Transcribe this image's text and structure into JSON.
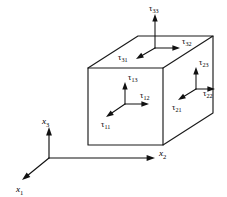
{
  "figure": {
    "background_color": "#ffffff",
    "line_color": "#1a1a1a",
    "text_color": "#000000",
    "width": 227,
    "height": 197
  },
  "axes": {
    "origin": {
      "x": 49,
      "y": 158
    },
    "items": [
      {
        "name": "x1",
        "symbol": "x",
        "subscript": "1",
        "direction": "down-left",
        "tip": {
          "x": 22,
          "y": 180
        },
        "label_pos": {
          "x": 16,
          "y": 192
        }
      },
      {
        "name": "x2",
        "symbol": "x",
        "subscript": "2",
        "direction": "right",
        "tip": {
          "x": 155,
          "y": 158
        },
        "label_pos": {
          "x": 159,
          "y": 156
        }
      },
      {
        "name": "x3",
        "symbol": "x",
        "subscript": "3",
        "direction": "up",
        "tip": {
          "x": 49,
          "y": 127
        },
        "label_pos": {
          "x": 42,
          "y": 124
        }
      }
    ]
  },
  "cube": {
    "front_face": {
      "x": 88,
      "y": 68,
      "width": 75,
      "height": 77
    },
    "depth_offset": {
      "dx": 50,
      "dy": -32
    },
    "vertices": {
      "front_top_left": {
        "x": 88,
        "y": 68
      },
      "front_top_right": {
        "x": 163,
        "y": 68
      },
      "front_bottom_right": {
        "x": 163,
        "y": 145
      },
      "front_bottom_left": {
        "x": 88,
        "y": 145
      },
      "back_top_left": {
        "x": 138,
        "y": 36
      },
      "back_top_right": {
        "x": 213,
        "y": 36
      },
      "back_bottom_right": {
        "x": 213,
        "y": 113
      }
    }
  },
  "tractions": [
    {
      "name": "tau-33",
      "symbol": "τ",
      "subscript": "33",
      "face": "top",
      "component": "normal",
      "origin": {
        "x": 155,
        "y": 48
      },
      "tip": {
        "x": 155,
        "y": 14
      },
      "label_pos": {
        "x": 149,
        "y": 11
      }
    },
    {
      "name": "tau-32",
      "symbol": "τ",
      "subscript": "32",
      "face": "top",
      "component": "shear",
      "origin": {
        "x": 155,
        "y": 48
      },
      "tip": {
        "x": 180,
        "y": 48
      },
      "label_pos": {
        "x": 182,
        "y": 44
      }
    },
    {
      "name": "tau-31",
      "symbol": "τ",
      "subscript": "31",
      "face": "top",
      "component": "shear",
      "origin": {
        "x": 155,
        "y": 48
      },
      "tip": {
        "x": 136,
        "y": 59
      },
      "label_pos": {
        "x": 118,
        "y": 60
      }
    },
    {
      "name": "tau-13",
      "symbol": "τ",
      "subscript": "13",
      "face": "front",
      "component": "shear",
      "origin": {
        "x": 125,
        "y": 104
      },
      "tip": {
        "x": 125,
        "y": 82
      },
      "label_pos": {
        "x": 128,
        "y": 80
      }
    },
    {
      "name": "tau-12",
      "symbol": "τ",
      "subscript": "12",
      "face": "front",
      "component": "shear",
      "origin": {
        "x": 125,
        "y": 104
      },
      "tip": {
        "x": 149,
        "y": 104
      },
      "label_pos": {
        "x": 140,
        "y": 98
      }
    },
    {
      "name": "tau-11",
      "symbol": "τ",
      "subscript": "11",
      "face": "front",
      "component": "normal",
      "origin": {
        "x": 125,
        "y": 104
      },
      "tip": {
        "x": 106,
        "y": 117
      },
      "label_pos": {
        "x": 101,
        "y": 127
      }
    },
    {
      "name": "tau-23",
      "symbol": "τ",
      "subscript": "23",
      "face": "right",
      "component": "shear",
      "origin": {
        "x": 196,
        "y": 89
      },
      "tip": {
        "x": 196,
        "y": 67
      },
      "label_pos": {
        "x": 199,
        "y": 65
      }
    },
    {
      "name": "tau-22",
      "symbol": "τ",
      "subscript": "22",
      "face": "right",
      "component": "normal",
      "origin": {
        "x": 196,
        "y": 89
      },
      "tip": {
        "x": 215,
        "y": 89
      },
      "label_pos": {
        "x": 203,
        "y": 96
      }
    },
    {
      "name": "tau-21",
      "symbol": "τ",
      "subscript": "21",
      "face": "right",
      "component": "shear",
      "origin": {
        "x": 196,
        "y": 89
      },
      "tip": {
        "x": 178,
        "y": 100
      },
      "label_pos": {
        "x": 172,
        "y": 110
      }
    }
  ]
}
